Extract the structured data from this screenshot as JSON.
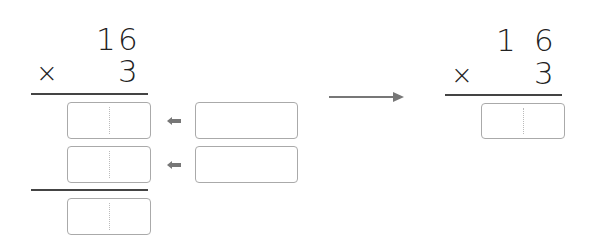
{
  "left_problem": {
    "multiplicand": {
      "tens": "1",
      "ones": "6"
    },
    "operator": "×",
    "multiplier": "3",
    "partial_boxes": 2,
    "sum_box": 1,
    "side_boxes": 2
  },
  "right_problem": {
    "multiplicand": {
      "tens": "1",
      "ones": "6"
    },
    "operator": "×",
    "multiplier": "3",
    "answer_box": 1
  },
  "colors": {
    "line": "#444444",
    "box_border": "#aaaaaa",
    "arrow": "#777777",
    "text": "#222222"
  }
}
